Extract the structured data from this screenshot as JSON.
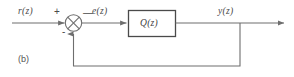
{
  "figure": {
    "panel_label": "(b)",
    "type": "block-diagram",
    "colors": {
      "line": "#6e6e6e",
      "text": "#4a4a4a",
      "background": "#ffffff"
    }
  },
  "signals": {
    "input": "r(z)",
    "error": "e(z)",
    "output": "y(z)"
  },
  "summing_junction": {
    "name": "summing-junction",
    "symbol": "crossed-circle",
    "positive_sign": "+",
    "negative_sign_input": "-",
    "negative_sign_feedback": "—"
  },
  "blocks": [
    {
      "id": "controller",
      "label": "Q(z)"
    }
  ],
  "connections": [
    {
      "from": "input",
      "to": "summing-junction",
      "label": "r(z)"
    },
    {
      "from": "summing-junction",
      "to": "controller",
      "label": "e(z)"
    },
    {
      "from": "controller",
      "to": "output",
      "label": "y(z)"
    },
    {
      "from": "output-tap",
      "to": "summing-junction",
      "label": "feedback"
    }
  ]
}
